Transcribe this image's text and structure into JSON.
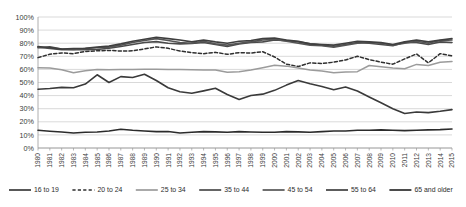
{
  "chart_data": {
    "type": "line",
    "title": "",
    "subtitle": "",
    "xlabel": "",
    "ylabel": "",
    "ylim": [
      0,
      100
    ],
    "ytick_labels": [
      "0%",
      "10%",
      "20%",
      "30%",
      "40%",
      "50%",
      "60%",
      "70%",
      "80%",
      "90%",
      "100%"
    ],
    "ytick_values": [
      0,
      10,
      20,
      30,
      40,
      50,
      60,
      70,
      80,
      90,
      100
    ],
    "grid": true,
    "legend_position": "bottom",
    "x": [
      "1980",
      "1981",
      "1982",
      "1983",
      "1984",
      "1985",
      "1986",
      "1987",
      "1988",
      "1989",
      "1990",
      "1991",
      "1992",
      "1993",
      "1994",
      "1995",
      "1996",
      "1997",
      "1998",
      "1999",
      "2000",
      "2001",
      "2002",
      "2003",
      "2004",
      "2005",
      "2006",
      "2007",
      "2008",
      "2009",
      "2010",
      "2011",
      "2012",
      "2013",
      "2014",
      "2015"
    ],
    "series": [
      {
        "name": "16 to 19",
        "style": "solid",
        "color": "#3a3a3a",
        "width": 1.6,
        "values": [
          44.8,
          45.4,
          46.3,
          46.0,
          48.8,
          55.9,
          50.0,
          54.5,
          53.8,
          56.3,
          51.5,
          46.0,
          43.0,
          41.8,
          43.6,
          45.6,
          40.8,
          37.0,
          40.1,
          41.1,
          44.0,
          48.0,
          51.5,
          49.0,
          47.0,
          44.5,
          46.5,
          43.5,
          39.0,
          34.5,
          30.0,
          26.3,
          27.5,
          27.0,
          28.0,
          29.3
        ]
      },
      {
        "name": "20 to 24",
        "style": "dashed",
        "color": "#2f2f2f",
        "width": 1.5,
        "values": [
          69.0,
          71.6,
          72.6,
          72.0,
          73.7,
          74.2,
          74.5,
          74.0,
          74.2,
          75.6,
          77.2,
          76.1,
          74.0,
          72.8,
          72.0,
          73.0,
          71.5,
          72.8,
          72.5,
          73.5,
          69.5,
          64.0,
          62.2,
          65.0,
          64.5,
          65.5,
          67.2,
          70.0,
          67.5,
          65.5,
          64.0,
          68.0,
          71.8,
          65.0,
          72.0,
          70.3
        ]
      },
      {
        "name": "25 to 34",
        "style": "solid",
        "color": "#9b9b9b",
        "width": 1.5,
        "values": [
          61.2,
          61.0,
          59.8,
          57.5,
          59.0,
          60.0,
          59.8,
          60.0,
          60.0,
          60.2,
          60.1,
          60.0,
          60.0,
          59.8,
          59.6,
          59.5,
          57.8,
          58.2,
          59.5,
          61.3,
          63.2,
          62.5,
          61.0,
          59.5,
          58.8,
          57.5,
          58.0,
          58.3,
          63.0,
          62.0,
          61.0,
          60.5,
          63.8,
          63.0,
          65.5,
          66.0
        ]
      },
      {
        "name": "35 to 44",
        "style": "solid",
        "color": "#4a4a4a",
        "width": 1.6,
        "values": [
          76.5,
          77.2,
          75.5,
          75.0,
          75.0,
          75.2,
          76.2,
          77.5,
          79.0,
          80.5,
          81.2,
          80.0,
          79.5,
          79.8,
          80.5,
          79.0,
          77.5,
          79.5,
          80.5,
          81.0,
          82.5,
          82.0,
          81.0,
          79.5,
          78.5,
          77.5,
          79.0,
          80.5,
          80.0,
          79.0,
          78.0,
          80.8,
          80.5,
          79.0,
          81.0,
          80.5
        ]
      },
      {
        "name": "45 to 54",
        "style": "solid",
        "color": "#555555",
        "width": 1.6,
        "values": [
          77.0,
          76.0,
          75.0,
          75.2,
          76.0,
          76.5,
          77.0,
          78.5,
          80.5,
          82.0,
          83.5,
          82.0,
          80.5,
          80.0,
          81.5,
          79.5,
          78.5,
          80.0,
          81.0,
          82.5,
          83.0,
          81.5,
          80.0,
          78.5,
          78.0,
          77.0,
          78.5,
          80.0,
          80.5,
          80.0,
          78.5,
          80.0,
          81.5,
          80.0,
          82.0,
          82.5
        ]
      },
      {
        "name": "55 to 64",
        "style": "solid",
        "color": "#3f3f3f",
        "width": 1.6,
        "values": [
          77.5,
          76.5,
          75.5,
          76.0,
          76.2,
          77.0,
          77.8,
          79.5,
          81.5,
          83.0,
          84.5,
          83.5,
          82.5,
          81.0,
          82.5,
          81.0,
          80.0,
          81.5,
          82.0,
          83.5,
          84.0,
          82.5,
          81.5,
          79.5,
          79.0,
          78.5,
          80.0,
          81.5,
          81.0,
          80.5,
          79.0,
          81.0,
          82.5,
          81.0,
          82.5,
          83.5
        ]
      },
      {
        "name": "65 and older",
        "style": "solid",
        "color": "#2b2b2b",
        "width": 1.6,
        "values": [
          13.5,
          12.8,
          12.2,
          11.5,
          12.0,
          12.2,
          13.0,
          14.3,
          13.5,
          13.0,
          12.5,
          12.6,
          11.5,
          12.0,
          12.5,
          12.3,
          12.0,
          12.5,
          12.2,
          12.0,
          12.0,
          12.5,
          12.3,
          12.0,
          12.5,
          13.0,
          13.0,
          13.5,
          13.5,
          13.8,
          13.5,
          13.3,
          13.5,
          13.8,
          14.0,
          14.5
        ]
      }
    ],
    "legend": [
      {
        "label": "16 to 19",
        "style": "solid",
        "color": "#3a3a3a"
      },
      {
        "label": "20 to 24",
        "style": "dashed",
        "color": "#2f2f2f"
      },
      {
        "label": "25 to 34",
        "style": "solid",
        "color": "#9b9b9b"
      },
      {
        "label": "35 to 44",
        "style": "solid",
        "color": "#4a4a4a"
      },
      {
        "label": "45 to 54",
        "style": "solid",
        "color": "#555555"
      },
      {
        "label": "55 to 64",
        "style": "solid",
        "color": "#3f3f3f"
      },
      {
        "label": "65 and older",
        "style": "solid",
        "color": "#2b2b2b"
      }
    ]
  }
}
